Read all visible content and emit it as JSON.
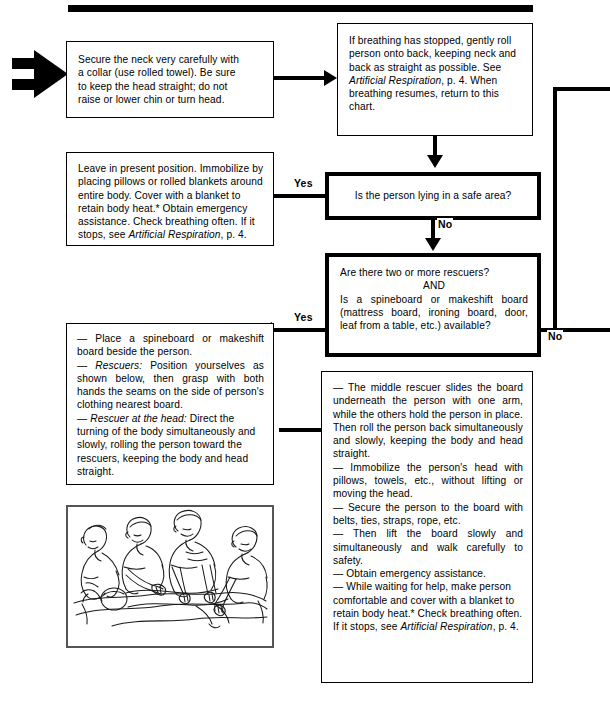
{
  "chart_title": "First aid flowchart — suspected neck/spine injury",
  "decorations": {
    "top_rule": "solid-black-bar",
    "entry_arrow": "double-bar-right-arrow"
  },
  "boxes": {
    "secure_neck": {
      "name": "secure-the-neck",
      "lines": [
        "Secure the neck very carefully with",
        "a collar (use rolled towel). Be sure",
        "to keep the head straight; do not",
        "raise or lower chin or turn head."
      ]
    },
    "breathing_stopped": {
      "name": "if-breathing-has-stopped",
      "p1": "If breathing has stopped, gently roll person onto back, keeping neck and back as straight as possible. See ",
      "italic1": "Artificial Respiration",
      "p2": ", p. 4. When breathing resumes, return to this chart."
    },
    "safe_area_question": {
      "name": "is-the-person-lying-in-a-safe-area",
      "text": "Is the person lying in a safe area?"
    },
    "rescuers_board_question": {
      "name": "two-or-more-rescuers-and-board-available",
      "line1": "Are there two or more rescuers?",
      "line2": "AND",
      "line3": "Is a spineboard or makeshift board (mattress board, ironing board, door, leaf from a table, etc.) available?"
    },
    "leave_in_position": {
      "name": "leave-in-present-position",
      "p1": "Leave in present position. Immobilize by placing pillows or rolled blankets around entire body. Cover with a blanket to retain body heat.* Obtain emergency assistance. Check breathing often. If it stops, see ",
      "italic1": "Artificial Respiration",
      "p2": ", p. 4."
    },
    "place_spineboard": {
      "name": "place-spineboard-and-position-rescuers",
      "b1": "— Place a spineboard or makeshift board beside the person.",
      "b2_em": "— Rescuers:",
      "b2": " Position yourselves as shown below, then grasp with both hands the seams on the side of person's clothing nearest board.",
      "b3_em": "— Rescuer at the head:",
      "b3": " Direct the turning of the body simultaneously and slowly, rolling the person toward the rescuers, keeping the body and head straight."
    },
    "middle_rescuer": {
      "name": "middle-rescuer-slides-board",
      "b1": "— The middle rescuer slides the board underneath the person with one arm, while the others hold the person in place. Then roll the person back simultaneously and slowly, keeping the body and head straight.",
      "b2": "— Immobilize the person's head with pillows, towels, etc., without lifting or moving the head.",
      "b3": "— Secure the person to the board with belts, ties, straps, rope, etc.",
      "b4": "— Then lift the board slowly and simultaneously and walk carefully to safety.",
      "b5": "— Obtain emergency assistance.",
      "b6_a": "— While waiting for help, make person comfortable and cover with a blanket to retain body heat.* Check breathing often. If it stops, see ",
      "b6_em": "Artificial Respiration",
      "b6_b": ", p. 4."
    }
  },
  "labels": {
    "yes_safe_area": "Yes",
    "no_safe_area": "No",
    "yes_board": "Yes",
    "no_board": "No"
  },
  "illustration": {
    "name": "four-rescuers-log-roll-illustration",
    "caption": "Four rescuers kneeling beside a person lying face down, grasping clothing seams to log-roll the person"
  }
}
